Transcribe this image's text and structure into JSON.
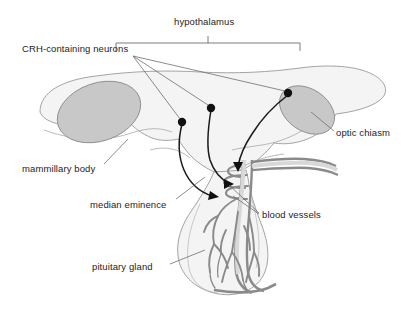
{
  "figure": {
    "width": 401,
    "height": 312,
    "background": "#ffffff"
  },
  "colors": {
    "brain_fill": "#f4f4f4",
    "brain_stroke": "#9a9a9a",
    "ellipse_fill": "#c8c8c8",
    "ellipse_stroke": "#8f8f8f",
    "vessel_stroke": "#8a8a8a",
    "vessel_fill": "#d8d8d8",
    "neuron_stroke": "#1a1a1a",
    "neuron_body": "#111111",
    "leader_line": "#6e6e6e",
    "bracket": "#6e6e6e",
    "label_text": "#1d1d1d"
  },
  "labels": {
    "hypothalamus": "hypothalamus",
    "crh_neurons": "CRH-containing neurons",
    "optic_chiasm": "optic chiasm",
    "mammillary_body": "mammillary body",
    "median_eminence": "median eminence",
    "blood_vessels": "blood vessels",
    "pituitary_gland": "pituitary gland"
  },
  "structures": [
    {
      "name": "hypothalamus-outline",
      "kind": "brain-region"
    },
    {
      "name": "mammillary-body",
      "kind": "ellipse",
      "shade": "gray"
    },
    {
      "name": "optic-chiasm",
      "kind": "ellipse",
      "shade": "gray"
    },
    {
      "name": "median-eminence",
      "kind": "capillary-plexus"
    },
    {
      "name": "pituitary-gland",
      "kind": "bulb"
    },
    {
      "name": "blood-vessels",
      "kind": "vascular-tree"
    }
  ],
  "neurons": [
    {
      "name": "crh-neuron-left",
      "soma_x": 182,
      "soma_y": 122
    },
    {
      "name": "crh-neuron-middle",
      "soma_x": 211,
      "soma_y": 108
    },
    {
      "name": "crh-neuron-right",
      "soma_x": 288,
      "soma_y": 93
    }
  ],
  "bracket": {
    "name": "hypothalamus-bracket",
    "left_x": 116,
    "right_x": 300,
    "y": 43,
    "tick_x": 208
  }
}
